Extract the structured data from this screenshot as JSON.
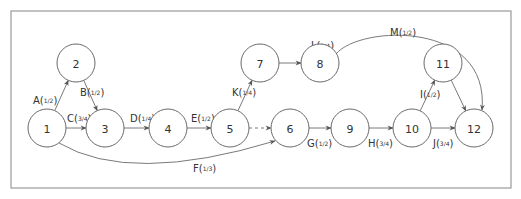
{
  "diagram": {
    "type": "activity-on-arrow network",
    "frame": {
      "x": 11,
      "y": 11,
      "w": 500,
      "h": 177
    },
    "nodes": [
      {
        "id": "1",
        "label": "1",
        "x": 47,
        "y": 128
      },
      {
        "id": "2",
        "label": "2",
        "x": 76,
        "y": 63
      },
      {
        "id": "3",
        "label": "3",
        "x": 105,
        "y": 128
      },
      {
        "id": "4",
        "label": "4",
        "x": 168,
        "y": 128
      },
      {
        "id": "5",
        "label": "5",
        "x": 230,
        "y": 128
      },
      {
        "id": "6",
        "label": "6",
        "x": 290,
        "y": 128
      },
      {
        "id": "7",
        "label": "7",
        "x": 260,
        "y": 63
      },
      {
        "id": "8",
        "label": "8",
        "x": 320,
        "y": 63
      },
      {
        "id": "9",
        "label": "9",
        "x": 350,
        "y": 128
      },
      {
        "id": "10",
        "label": "10",
        "x": 412,
        "y": 128
      },
      {
        "id": "11",
        "label": "11",
        "x": 443,
        "y": 63
      },
      {
        "id": "12",
        "label": "12",
        "x": 474,
        "y": 128
      }
    ],
    "edges": [
      {
        "id": "A",
        "from": "1",
        "to": "2",
        "activity": "A",
        "num": "1",
        "den": "2"
      },
      {
        "id": "B",
        "from": "2",
        "to": "3",
        "activity": "B",
        "num": "1",
        "den": "2"
      },
      {
        "id": "C",
        "from": "1",
        "to": "3",
        "activity": "C",
        "num": "3",
        "den": "4"
      },
      {
        "id": "D",
        "from": "3",
        "to": "4",
        "activity": "D",
        "num": "1",
        "den": "4"
      },
      {
        "id": "E",
        "from": "4",
        "to": "5",
        "activity": "E",
        "num": "1",
        "den": "2"
      },
      {
        "id": "F",
        "from": "1",
        "to": "6",
        "activity": "F",
        "num": "1",
        "den": "3"
      },
      {
        "id": "G",
        "from": "6",
        "to": "9",
        "activity": "G",
        "num": "1",
        "den": "2"
      },
      {
        "id": "H",
        "from": "9",
        "to": "10",
        "activity": "H",
        "num": "3",
        "den": "4"
      },
      {
        "id": "I",
        "from": "10",
        "to": "11",
        "activity": "I",
        "num": "1",
        "den": "2"
      },
      {
        "id": "J",
        "from": "10",
        "to": "12",
        "activity": "J",
        "num": "3",
        "den": "4"
      },
      {
        "id": "K",
        "from": "5",
        "to": "7",
        "activity": "K",
        "num": "1",
        "den": "4"
      },
      {
        "id": "L",
        "from": "7",
        "to": "8",
        "activity": "L",
        "num": "1",
        "den": "4"
      },
      {
        "id": "M",
        "from": "8",
        "to": "12",
        "activity": "M",
        "num": "1",
        "den": "2"
      },
      {
        "id": "dummy",
        "from": "5",
        "to": "6",
        "activity": "",
        "style": "dashed"
      },
      {
        "id": "11-12",
        "from": "11",
        "to": "12",
        "activity": ""
      }
    ],
    "colors": {
      "stroke": "#7a7a7a",
      "text": "#333333",
      "frame": "#9a9a9a"
    }
  }
}
